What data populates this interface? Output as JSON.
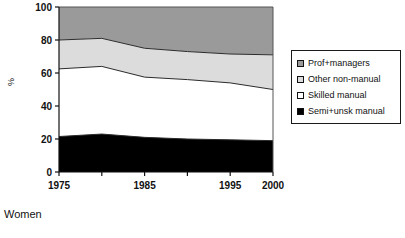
{
  "caption": "Women",
  "legend": {
    "items": [
      {
        "label": "Prof+managers",
        "key": "prof_managers",
        "color": "#9a9a9a"
      },
      {
        "label": "Other non-manual",
        "key": "other_non_manual",
        "color": "#dcdcdc"
      },
      {
        "label": "Skilled manual",
        "key": "skilled_manual",
        "color": "#ffffff"
      },
      {
        "label": "Semi+unsk manual",
        "key": "semi_unsk_manual",
        "color": "#000000"
      }
    ]
  },
  "chart_data": {
    "type": "area",
    "stacked": true,
    "title": "",
    "subtitle": "",
    "xlabel": "",
    "ylabel": "%",
    "x": [
      1975,
      1980,
      1985,
      1990,
      1995,
      2000
    ],
    "xtick_labels": [
      "1975",
      "",
      "1985",
      "",
      "1995",
      "2000"
    ],
    "xtick_values": [
      1975,
      1980,
      1985,
      1990,
      1995,
      2000
    ],
    "xlim": [
      1975,
      2000
    ],
    "ylim": [
      0,
      100
    ],
    "ytick_values": [
      0,
      20,
      40,
      60,
      80,
      100
    ],
    "ytick_labels": [
      "0",
      "20",
      "40",
      "60",
      "80",
      "100"
    ],
    "grid": false,
    "legend_position": "right",
    "series": [
      {
        "name": "Semi+unsk manual",
        "color": "#000000",
        "values": [
          21.5,
          23.0,
          21.0,
          20.0,
          19.5,
          19.0
        ],
        "cumulative_top": [
          21.5,
          23.0,
          21.0,
          20.0,
          19.5,
          19.0
        ]
      },
      {
        "name": "Skilled manual",
        "color": "#ffffff",
        "values": [
          41.0,
          41.0,
          36.5,
          36.0,
          34.5,
          31.0
        ],
        "cumulative_top": [
          62.5,
          64.0,
          57.5,
          56.0,
          54.0,
          50.0
        ]
      },
      {
        "name": "Other non-manual",
        "color": "#dcdcdc",
        "values": [
          17.5,
          17.0,
          17.5,
          17.0,
          17.5,
          21.0
        ],
        "cumulative_top": [
          80.0,
          81.0,
          75.0,
          73.0,
          71.5,
          71.0
        ]
      },
      {
        "name": "Prof+managers",
        "color": "#9a9a9a",
        "values": [
          20.0,
          19.0,
          25.0,
          27.0,
          28.5,
          29.0
        ],
        "cumulative_top": [
          100,
          100,
          100,
          100,
          100,
          100
        ]
      }
    ]
  }
}
